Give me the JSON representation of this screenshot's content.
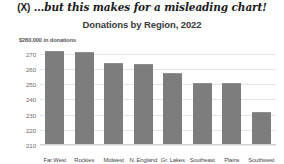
{
  "annotation": {
    "marker": "(X)",
    "text": "…but this makes for a misleading chart!"
  },
  "chart_data": {
    "type": "bar",
    "title": "Donations by Region, 2022",
    "subtitle": "$280,000 in donations",
    "xlabel": "",
    "ylabel": "$280,000 in donations",
    "categories": [
      "Far West",
      "Rockies",
      "Midwest",
      "N. England",
      "Gr. Lakes",
      "Southeast",
      "Plains",
      "Southwest"
    ],
    "values": [
      272,
      271,
      264,
      263,
      257,
      251,
      250.5,
      232
    ],
    "ylim": [
      210,
      275
    ],
    "yticks": [
      270,
      260,
      250,
      240,
      230,
      220,
      210
    ],
    "ytick_labels": [
      "270",
      "260",
      "250",
      "240",
      "230",
      "220",
      "210"
    ],
    "grid": true,
    "legend": false,
    "bar_color": "#7d7d7d",
    "grid_color": "#e6e6e6",
    "truncated_axis": true
  }
}
